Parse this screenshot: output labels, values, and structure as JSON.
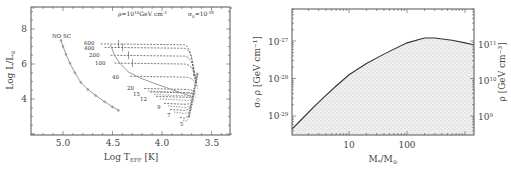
{
  "chart_data": [
    {
      "type": "line",
      "title": "",
      "annotation": {
        "rho": "ρ=10¹⁰GeV cm⁻³",
        "sigma": "σ₀=10⁻³⁸"
      },
      "xlabel": "Log T_EFF [K]",
      "ylabel": "Log L/L⊙",
      "xlim": [
        5.32,
        3.31
      ],
      "ylim": [
        1.94,
        9.26
      ],
      "x_reversed": true,
      "xticks": [
        5.0,
        4.5,
        4.0,
        3.5
      ],
      "xtick_labels": [
        "5.0",
        "4.5",
        "4.0",
        "3.5"
      ],
      "yticks": [
        8,
        6,
        4
      ],
      "ytick_labels": [
        "8",
        "6",
        "4"
      ],
      "grid": false,
      "series": [
        {
          "name": "NO SC",
          "style": "solid-grey-with-markers",
          "x": [
            5.02,
            5.0,
            4.97,
            4.93,
            4.88,
            4.82,
            4.75,
            4.67,
            4.58,
            4.5,
            4.44
          ],
          "y": [
            7.35,
            7.0,
            6.55,
            6.05,
            5.5,
            4.95,
            4.55,
            4.2,
            3.85,
            3.55,
            3.35
          ]
        },
        {
          "name": "SC ZAMS",
          "style": "solid-grey",
          "x": [
            4.52,
            4.48,
            4.42,
            4.34,
            4.22,
            4.08,
            3.93,
            3.78,
            3.7
          ],
          "y": [
            7.1,
            6.5,
            6.0,
            5.55,
            5.2,
            4.9,
            4.6,
            4.3,
            4.15
          ]
        }
      ],
      "tracks": [
        {
          "mass": "600",
          "T_start": 4.62,
          "L": 7.15,
          "T_end": 3.68
        },
        {
          "mass": "400",
          "T_start": 4.58,
          "L": 6.95,
          "T_end": 3.67
        },
        {
          "mass": "200",
          "T_start": 4.52,
          "L": 6.5,
          "T_end": 3.66
        },
        {
          "mass": "100",
          "T_start": 4.48,
          "L": 6.05,
          "T_end": 3.65
        },
        {
          "mass": "40",
          "T_start": 4.32,
          "L": 5.3,
          "T_end": 3.64
        },
        {
          "mass": "20",
          "T_start": 4.18,
          "L": 4.6,
          "T_end": 3.66
        },
        {
          "mass": "15",
          "T_start": 4.12,
          "L": 4.4,
          "T_end": 3.67
        },
        {
          "mass": "12",
          "T_start": 4.06,
          "L": 4.15,
          "T_end": 3.68
        },
        {
          "mass": "9",
          "T_start": 3.98,
          "L": 3.75,
          "T_end": 3.7
        },
        {
          "mass": "7",
          "T_start": 3.92,
          "L": 3.4,
          "T_end": 3.71
        },
        {
          "mass": "5",
          "T_start": 3.82,
          "L": 2.95,
          "T_end": 3.73
        }
      ]
    },
    {
      "type": "area",
      "title": "",
      "xlabel": "M*/M⊙",
      "ylabel": "σ₀ ρ [GeV cm⁻¹]",
      "ylabel_right": "ρ [GeV cm⁻³]",
      "xscale": "log",
      "yscale": "log",
      "xlim": [
        1.04,
        1400
      ],
      "ylim_exp": [
        -29.5,
        -26.15
      ],
      "xticks": [
        10,
        100
      ],
      "xtick_labels": [
        "10",
        "100"
      ],
      "yticks_left": [
        "10⁻²⁷",
        "10⁻²⁸",
        "10⁻²⁹"
      ],
      "yticks_right": [
        "10¹¹",
        "10¹⁰",
        "10⁹"
      ],
      "grid": false,
      "fill": "stippled-grey below curve",
      "series": [
        {
          "name": "boundary",
          "x": [
            1.04,
            1.5,
            2.5,
            4,
            6,
            10,
            20,
            40,
            100,
            200,
            300,
            600,
            1000,
            1400
          ],
          "log10_y": [
            -29.35,
            -29.1,
            -28.75,
            -28.45,
            -28.2,
            -27.9,
            -27.6,
            -27.35,
            -27.05,
            -26.92,
            -26.92,
            -26.98,
            -27.05,
            -27.1
          ]
        }
      ]
    }
  ],
  "labels": {
    "left": {
      "rho_anno_base": "ρ=10",
      "rho_anno_exp": "10",
      "rho_anno_unit": "GeV cm",
      "rho_anno_unit_exp": "-3",
      "sigma_anno_base": "σ",
      "sigma_anno_sub": "0",
      "sigma_anno_eq": "=10",
      "sigma_anno_exp": "-38",
      "ylabel_main": "Log L/L",
      "ylabel_sub": "⊙",
      "xlabel_main": "Log T",
      "xlabel_sub": "EFF",
      "xlabel_unit": " [K]",
      "noSC": "NO SC",
      "masses": [
        "600",
        "400",
        "200",
        "100",
        "40",
        "20",
        "15",
        "12",
        "9",
        "7",
        "5"
      ],
      "xticks": [
        "5.0",
        "4.5",
        "4.0",
        "3.5"
      ],
      "yticks": [
        "8",
        "6",
        "4"
      ]
    },
    "right": {
      "xlabel": "M",
      "xlabel_sub": "*",
      "xlabel_mid": "/M",
      "xlabel_sub2": "⊙",
      "ylabel_left": "σ₀ ρ [GeV cm⁻¹]",
      "ylabel_right": "ρ [GeV cm⁻³]",
      "xticks": [
        "10",
        "100"
      ],
      "yleft_base": "10",
      "yleft_exps": [
        "-27",
        "-28",
        "-29"
      ],
      "yright_base": "10",
      "yright_exps": [
        "11",
        "10",
        "9"
      ]
    }
  }
}
